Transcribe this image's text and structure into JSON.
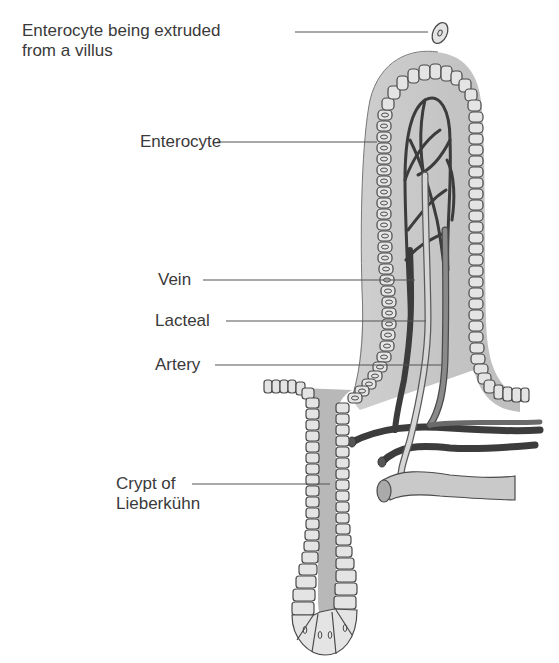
{
  "figure": {
    "labels": [
      {
        "id": "enterocyte-extruded",
        "line1": "Enterocyte being extruded",
        "line2": "from a villus"
      },
      {
        "id": "enterocyte",
        "line1": "Enterocyte"
      },
      {
        "id": "vein",
        "line1": "Vein"
      },
      {
        "id": "lacteal",
        "line1": "Lacteal"
      },
      {
        "id": "artery",
        "line1": "Artery"
      },
      {
        "id": "crypt",
        "line1": "Crypt of",
        "line2": "Lieberkühn"
      }
    ]
  },
  "colors": {
    "stroma": "#c9c9c9",
    "cell_fill": "#e4e4e4",
    "outline": "#4a4a4a",
    "vein": "#3c3c3c",
    "artery": "#8a8a8a",
    "lacteal": "#d6d6d6",
    "leader_line": "#555555",
    "text": "#3a3a3a"
  }
}
